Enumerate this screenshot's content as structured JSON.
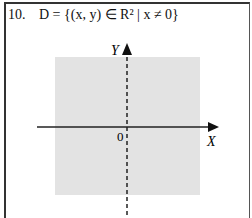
{
  "problem": {
    "number": "10.",
    "definition": "D = {(x, y) ∈ R² | x ≠ 0}"
  },
  "diagram": {
    "x_label": "X",
    "y_label": "Y",
    "origin_label": "0",
    "region_color": "#e3e3e3",
    "axis_color": "#222222",
    "excluded_line": "x = 0 (dashed)"
  }
}
